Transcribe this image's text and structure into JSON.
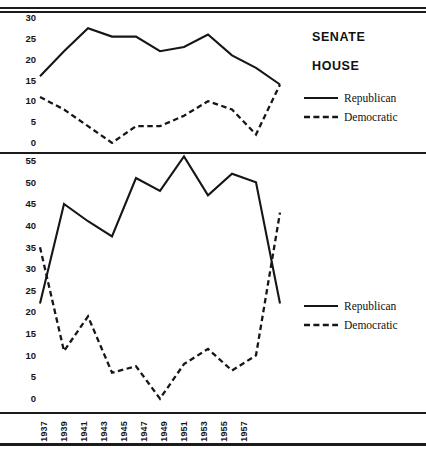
{
  "chart_data": [
    {
      "type": "line",
      "title": "SENATE",
      "xlabel": "",
      "ylabel": "",
      "ylim": [
        0,
        30
      ],
      "yticks": [
        0,
        5,
        10,
        15,
        20,
        25,
        30
      ],
      "x": [
        1937,
        1939,
        1941,
        1943,
        1945,
        1947,
        1949,
        1951,
        1953,
        1955,
        1957
      ],
      "grid": false,
      "legend_position": "right",
      "series": [
        {
          "name": "Republican",
          "style": "solid",
          "values": [
            17,
            23,
            28.5,
            26.5,
            26.5,
            23,
            24,
            27,
            22,
            19,
            15
          ]
        },
        {
          "name": "Democratic",
          "style": "dashed",
          "values": [
            12,
            9,
            5,
            1,
            5,
            5,
            7.5,
            11,
            9,
            3,
            15
          ]
        }
      ]
    },
    {
      "type": "line",
      "title": "HOUSE",
      "xlabel": "",
      "ylabel": "",
      "ylim": [
        0,
        55
      ],
      "yticks": [
        0,
        5,
        10,
        15,
        20,
        25,
        30,
        35,
        40,
        45,
        50,
        55
      ],
      "x": [
        1937,
        1939,
        1941,
        1943,
        1945,
        1947,
        1949,
        1951,
        1953,
        1955,
        1957
      ],
      "grid": false,
      "legend_position": "right",
      "series": [
        {
          "name": "Republican",
          "style": "solid",
          "values": [
            23,
            46,
            42,
            38.5,
            52,
            49,
            57,
            48,
            53,
            51,
            23
          ]
        },
        {
          "name": "Democratic",
          "style": "dashed",
          "values": [
            36,
            12,
            20,
            7,
            8.5,
            1,
            9,
            12.5,
            7.5,
            11,
            44
          ]
        }
      ]
    }
  ],
  "senate": {
    "title": "SENATE",
    "yticks": [
      "30",
      "25",
      "20",
      "15",
      "10",
      "5",
      "0"
    ],
    "legend": [
      {
        "label": "Republican",
        "style": "solid"
      },
      {
        "label": "Democratic",
        "style": "dashed"
      }
    ]
  },
  "house": {
    "title": "HOUSE",
    "yticks": [
      "55",
      "50",
      "45",
      "40",
      "35",
      "30",
      "25",
      "20",
      "15",
      "10",
      "5",
      "0"
    ],
    "legend": [
      {
        "label": "Republican",
        "style": "solid"
      },
      {
        "label": "Democratic",
        "style": "dashed"
      }
    ]
  },
  "xaxis": {
    "labels": [
      "1937",
      "1939",
      "1941",
      "1943",
      "1945",
      "1947",
      "1949",
      "1951",
      "1953",
      "1955",
      "1957"
    ]
  },
  "colors": {
    "line": "#161616",
    "text": "#111111",
    "rule": "#1b1b1b",
    "background": "#ffffff"
  }
}
